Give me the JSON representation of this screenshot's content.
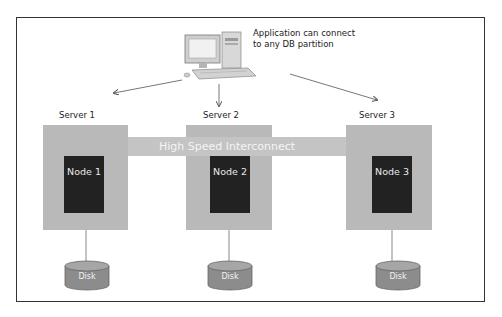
{
  "diagram": {
    "type": "shared-nothing database architecture",
    "client": {
      "icon": "desktop-computer-icon",
      "caption_line1": "Application can connect",
      "caption_line2": "to any DB partition"
    },
    "interconnect": {
      "label": "High Speed Interconnect"
    },
    "servers": [
      {
        "label": "Server 1",
        "node": "Node 1",
        "disk": "Disk"
      },
      {
        "label": "Server 2",
        "node": "Node 2",
        "disk": "Disk"
      },
      {
        "label": "Server 3",
        "node": "Node 3",
        "disk": "Disk"
      }
    ],
    "colors": {
      "server_box": "#b9b9b9",
      "interconnect": "#c4c4c4",
      "node": "#222222",
      "disk": "#8c8c8c",
      "frame": "#333333"
    }
  }
}
